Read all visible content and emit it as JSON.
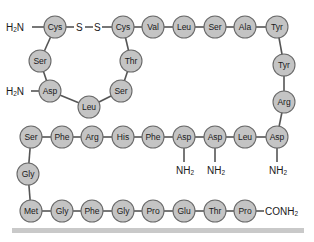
{
  "diagram": {
    "type": "peptide-sequence",
    "colors": {
      "residue_fill": "#c4c4c4",
      "residue_stroke": "#6a6a6a",
      "bond": "#555555",
      "bottom_bar": "#c9c9c9"
    },
    "residues": [
      {
        "id": "r1",
        "label": "Cys",
        "x": 55,
        "y": 27
      },
      {
        "id": "r2",
        "label": "Cys",
        "x": 123,
        "y": 27
      },
      {
        "id": "r3",
        "label": "Val",
        "x": 153,
        "y": 27
      },
      {
        "id": "r4",
        "label": "Leu",
        "x": 184,
        "y": 27
      },
      {
        "id": "r5",
        "label": "Ser",
        "x": 215,
        "y": 27
      },
      {
        "id": "r6",
        "label": "Ala",
        "x": 245,
        "y": 27
      },
      {
        "id": "r7",
        "label": "Tyr",
        "x": 277,
        "y": 27
      },
      {
        "id": "r8",
        "label": "Ser",
        "x": 40,
        "y": 61
      },
      {
        "id": "r9",
        "label": "Asp",
        "x": 50,
        "y": 91
      },
      {
        "id": "r10",
        "label": "Leu",
        "x": 89,
        "y": 107
      },
      {
        "id": "r11",
        "label": "Ser",
        "x": 121,
        "y": 91
      },
      {
        "id": "r12",
        "label": "Thr",
        "x": 131,
        "y": 61
      },
      {
        "id": "r13",
        "label": "Tyr",
        "x": 284,
        "y": 65
      },
      {
        "id": "r14",
        "label": "Arg",
        "x": 284,
        "y": 102
      },
      {
        "id": "r15",
        "label": "Asp",
        "x": 277,
        "y": 137
      },
      {
        "id": "r16",
        "label": "Leu",
        "x": 245,
        "y": 137
      },
      {
        "id": "r17",
        "label": "Asp",
        "x": 215,
        "y": 137
      },
      {
        "id": "r18",
        "label": "Asp",
        "x": 184,
        "y": 137
      },
      {
        "id": "r19",
        "label": "Phe",
        "x": 153,
        "y": 137
      },
      {
        "id": "r20",
        "label": "His",
        "x": 123,
        "y": 137
      },
      {
        "id": "r21",
        "label": "Arg",
        "x": 92,
        "y": 137
      },
      {
        "id": "r22",
        "label": "Phe",
        "x": 62,
        "y": 137
      },
      {
        "id": "r23",
        "label": "Ser",
        "x": 31,
        "y": 137
      },
      {
        "id": "r24",
        "label": "Gly",
        "x": 28,
        "y": 174
      },
      {
        "id": "r25",
        "label": "Met",
        "x": 31,
        "y": 211
      },
      {
        "id": "r26",
        "label": "Gly",
        "x": 62,
        "y": 211
      },
      {
        "id": "r27",
        "label": "Phe",
        "x": 92,
        "y": 211
      },
      {
        "id": "r28",
        "label": "Gly",
        "x": 123,
        "y": 211
      },
      {
        "id": "r29",
        "label": "Pro",
        "x": 153,
        "y": 211
      },
      {
        "id": "r30",
        "label": "Glu",
        "x": 184,
        "y": 211
      },
      {
        "id": "r31",
        "label": "Thr",
        "x": 215,
        "y": 211
      },
      {
        "id": "r32",
        "label": "Pro",
        "x": 245,
        "y": 211
      }
    ],
    "bonds": [
      [
        "r2",
        "r3"
      ],
      [
        "r3",
        "r4"
      ],
      [
        "r4",
        "r5"
      ],
      [
        "r5",
        "r6"
      ],
      [
        "r6",
        "r7"
      ],
      [
        "r1",
        "r8"
      ],
      [
        "r8",
        "r9"
      ],
      [
        "r9",
        "r10"
      ],
      [
        "r10",
        "r11"
      ],
      [
        "r11",
        "r12"
      ],
      [
        "r12",
        "r2"
      ],
      [
        "r7",
        "r13"
      ],
      [
        "r13",
        "r14"
      ],
      [
        "r14",
        "r15"
      ],
      [
        "r15",
        "r16"
      ],
      [
        "r16",
        "r17"
      ],
      [
        "r17",
        "r18"
      ],
      [
        "r18",
        "r19"
      ],
      [
        "r19",
        "r20"
      ],
      [
        "r20",
        "r21"
      ],
      [
        "r21",
        "r22"
      ],
      [
        "r22",
        "r23"
      ],
      [
        "r23",
        "r24"
      ],
      [
        "r24",
        "r25"
      ],
      [
        "r25",
        "r26"
      ],
      [
        "r26",
        "r27"
      ],
      [
        "r27",
        "r28"
      ],
      [
        "r28",
        "r29"
      ],
      [
        "r29",
        "r30"
      ],
      [
        "r30",
        "r31"
      ],
      [
        "r31",
        "r32"
      ]
    ],
    "disulfide": {
      "label_1": "S",
      "label_2": "S",
      "separator": "—"
    },
    "groups": {
      "n_term_top": {
        "main": "H",
        "sub": "2",
        "tail": "N"
      },
      "n_term_asp": {
        "main": "H",
        "sub": "2",
        "tail": "N"
      },
      "amide_1": {
        "main": "NH",
        "sub": "2"
      },
      "amide_2": {
        "main": "NH",
        "sub": "2"
      },
      "amide_3": {
        "main": "NH",
        "sub": "2"
      },
      "c_term": {
        "main": "CONH",
        "sub": "2"
      }
    }
  }
}
